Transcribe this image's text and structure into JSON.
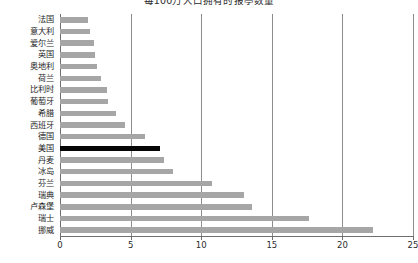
{
  "chart_data": {
    "type": "bar",
    "orientation": "horizontal",
    "title": "每100万人口拥有的报亭数量",
    "xlabel": "",
    "ylabel": "",
    "xlim": [
      0,
      25
    ],
    "xticks": [
      0,
      5,
      10,
      15,
      20,
      25
    ],
    "grid": true,
    "gridlines": "vertical",
    "legend": "none",
    "highlight_category": "美国",
    "colors": {
      "bar": "#a6a6a6",
      "bar_highlight": "#050505",
      "gridline": "#8d8d8d",
      "axis": "#6f6f6f",
      "background": "#ffffff",
      "text": "#1f1f1f"
    },
    "categories": [
      "法国",
      "意大利",
      "爱尔兰",
      "英国",
      "奥地利",
      "荷兰",
      "比利时",
      "葡萄牙",
      "希腊",
      "西班牙",
      "德国",
      "美国",
      "丹麦",
      "冰岛",
      "芬兰",
      "瑞典",
      "卢森堡",
      "瑞士",
      "挪威"
    ],
    "values": [
      2.0,
      2.1,
      2.4,
      2.5,
      2.6,
      2.9,
      3.3,
      3.4,
      4.0,
      4.6,
      6.0,
      7.1,
      7.4,
      8.0,
      10.8,
      13.0,
      13.6,
      17.6,
      22.2
    ]
  }
}
